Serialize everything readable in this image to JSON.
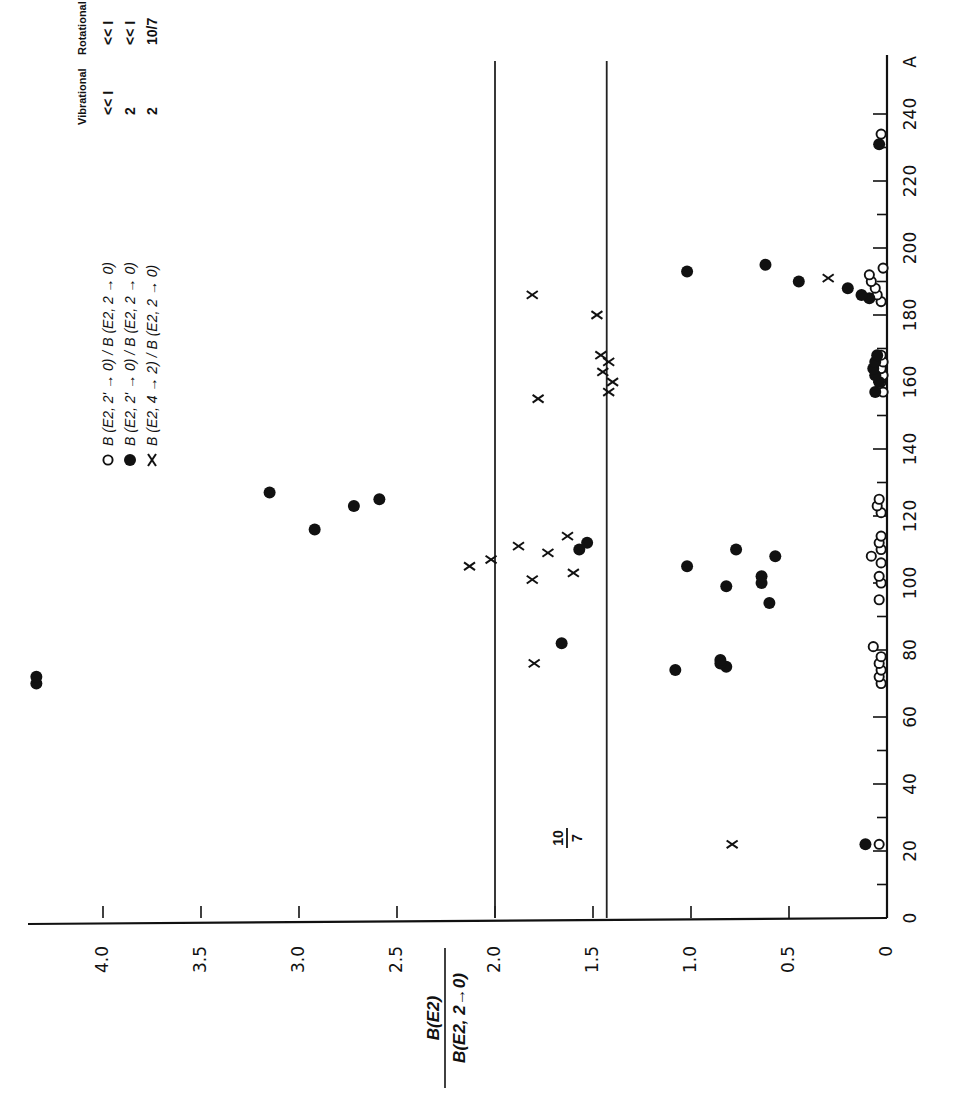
{
  "chart_data": {
    "type": "scatter",
    "orientation_note": "figure rotated 90 degrees clockwise",
    "xlabel": "A",
    "ylabel": "B(E2) / B(E2, 2→0)",
    "xlim": [
      0,
      250
    ],
    "ylim": [
      0,
      4.4
    ],
    "x_ticks": [
      0,
      20,
      40,
      60,
      80,
      100,
      120,
      140,
      160,
      180,
      200,
      220,
      240
    ],
    "y_ticks": [
      0,
      0.5,
      1.0,
      1.5,
      2.0,
      2.5,
      3.0,
      3.5,
      4.0
    ],
    "y_tick_labels": [
      "0",
      "0.5",
      "1.0",
      "1.5",
      "2.0",
      "2.5",
      "3.0",
      "3.5",
      "4.0"
    ],
    "x_tick_labels": [
      "0",
      "20",
      "40",
      "60",
      "80",
      "100",
      "120",
      "140",
      "160",
      "180",
      "200",
      "220",
      "240"
    ],
    "reference_lines": [
      {
        "value": 2.0,
        "label": ""
      },
      {
        "value": 1.43,
        "label": "10/7"
      }
    ],
    "grid": false,
    "legend": {
      "header": [
        "Vibrational",
        "Rotational"
      ],
      "entries": [
        {
          "symbol": "open-circle",
          "label": "B (E2, 2' → 0) / B (E2, 2 → 0)",
          "vibrational": "<< I",
          "rotational": "<< I"
        },
        {
          "symbol": "filled-circle",
          "label": "B (E2, 2' → 0) / B (E2, 2 → 0)",
          "vibrational": "2",
          "rotational": "<< I"
        },
        {
          "symbol": "cross",
          "label": "B (E2, 4 → 2) / B (E2, 2 → 0)",
          "vibrational": "2",
          "rotational": "10/7"
        }
      ]
    },
    "series": [
      {
        "name": "B(E2,2'→0)/B(E2,2→0)",
        "marker": "open-circle",
        "points": [
          [
            22,
            0.04
          ],
          [
            70,
            0.03
          ],
          [
            72,
            0.04
          ],
          [
            74,
            0.03
          ],
          [
            76,
            0.04
          ],
          [
            78,
            0.03
          ],
          [
            81,
            0.07
          ],
          [
            95,
            0.04
          ],
          [
            100,
            0.03
          ],
          [
            102,
            0.04
          ],
          [
            106,
            0.03
          ],
          [
            108,
            0.08
          ],
          [
            110,
            0.03
          ],
          [
            112,
            0.04
          ],
          [
            114,
            0.03
          ],
          [
            121,
            0.03
          ],
          [
            123,
            0.05
          ],
          [
            125,
            0.04
          ],
          [
            157,
            0.02
          ],
          [
            160,
            0.03
          ],
          [
            162,
            0.02
          ],
          [
            164,
            0.03
          ],
          [
            166,
            0.02
          ],
          [
            168,
            0.03
          ],
          [
            184,
            0.03
          ],
          [
            186,
            0.05
          ],
          [
            188,
            0.06
          ],
          [
            190,
            0.08
          ],
          [
            192,
            0.09
          ],
          [
            194,
            0.02
          ],
          [
            234,
            0.03
          ]
        ]
      },
      {
        "name": "B(E2,2'→0)/B(E2,2→0) (filled)",
        "marker": "filled-circle",
        "points": [
          [
            22,
            0.11
          ],
          [
            70,
            4.34
          ],
          [
            72,
            4.34
          ],
          [
            74,
            1.08
          ],
          [
            75,
            0.82
          ],
          [
            76,
            0.85
          ],
          [
            77,
            0.85
          ],
          [
            82,
            1.66
          ],
          [
            94,
            0.6
          ],
          [
            99,
            0.82
          ],
          [
            100,
            0.64
          ],
          [
            102,
            0.64
          ],
          [
            105,
            1.02
          ],
          [
            108,
            0.57
          ],
          [
            110,
            0.77
          ],
          [
            110,
            1.57
          ],
          [
            112,
            1.53
          ],
          [
            116,
            2.92
          ],
          [
            123,
            2.72
          ],
          [
            125,
            2.59
          ],
          [
            127,
            3.15
          ],
          [
            157,
            0.06
          ],
          [
            160,
            0.04
          ],
          [
            162,
            0.06
          ],
          [
            164,
            0.07
          ],
          [
            166,
            0.06
          ],
          [
            168,
            0.05
          ],
          [
            185,
            0.09
          ],
          [
            186,
            0.13
          ],
          [
            188,
            0.2
          ],
          [
            190,
            0.45
          ],
          [
            193,
            1.02
          ],
          [
            195,
            0.62
          ],
          [
            231,
            0.04
          ]
        ]
      },
      {
        "name": "B(E2,4→2)/B(E2,2→0)",
        "marker": "cross",
        "points": [
          [
            22,
            0.79
          ],
          [
            76,
            1.8
          ],
          [
            101,
            1.81
          ],
          [
            103,
            1.6
          ],
          [
            105,
            2.13
          ],
          [
            107,
            2.02
          ],
          [
            109,
            1.73
          ],
          [
            111,
            1.88
          ],
          [
            114,
            1.63
          ],
          [
            155,
            1.78
          ],
          [
            157,
            1.42
          ],
          [
            160,
            1.4
          ],
          [
            163,
            1.45
          ],
          [
            166,
            1.42
          ],
          [
            168,
            1.46
          ],
          [
            180,
            1.48
          ],
          [
            186,
            1.81
          ],
          [
            191,
            0.3
          ]
        ]
      }
    ]
  },
  "labels": {
    "ten_over_seven_num": "10",
    "ten_over_seven_den": "7",
    "y_axis_num": "B(E2)",
    "y_axis_den": "B(E2, 2→0)",
    "x_axis_unit": "A"
  }
}
